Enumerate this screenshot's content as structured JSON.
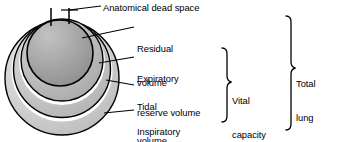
{
  "figure": {
    "kind": "lung-volumes-and-capacities-diagram",
    "background_color": "#ffffff",
    "line_color": "#000000",
    "text_color": "#000000"
  },
  "labels": {
    "anatomical_dead_space": "Anatomical dead space",
    "residual_volume_line1": "Residual",
    "residual_volume_line2": "volume",
    "expiratory_reserve_line1": "Expiratory",
    "expiratory_reserve_line2": "reserve volume",
    "tidal_volume_line1": "Tidal",
    "tidal_volume_line2": "volume",
    "inspiratory_reserve_line1": "Inspiratory",
    "inspiratory_reserve_line2": "reserve volume",
    "vital_capacity_line1": "Vital",
    "vital_capacity_line2": "capacity",
    "total_lung_capacity_line1": "Total",
    "total_lung_capacity_line2": "lung",
    "total_lung_capacity_line3": "capacity"
  },
  "regions": [
    {
      "name": "anatomical-dead-space",
      "shape": "tube",
      "fill": "#ffffff",
      "label": "Anatomical dead space"
    },
    {
      "name": "residual-volume",
      "shape": "circle",
      "fill": "#9a9a9a",
      "label": "Residual volume"
    },
    {
      "name": "expiratory-reserve-volume",
      "shape": "ring",
      "fill": "#b4b4b4",
      "label": "Expiratory reserve volume"
    },
    {
      "name": "tidal-volume",
      "shape": "ring",
      "fill": "#c6c6c6",
      "label": "Tidal volume"
    },
    {
      "name": "inspiratory-reserve-volume",
      "shape": "ring",
      "fill": "#d2d2d2",
      "label": "Inspiratory reserve volume"
    }
  ],
  "brackets": [
    {
      "name": "vital-capacity",
      "label": "Vital capacity",
      "spans": [
        "Expiratory reserve volume",
        "Tidal volume",
        "Inspiratory reserve volume"
      ]
    },
    {
      "name": "total-lung-capacity",
      "label": "Total lung capacity",
      "spans": [
        "Residual volume",
        "Expiratory reserve volume",
        "Tidal volume",
        "Inspiratory reserve volume"
      ]
    }
  ]
}
